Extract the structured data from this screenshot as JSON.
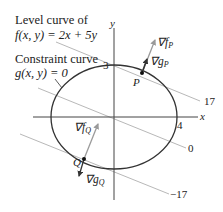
{
  "diagram": {
    "title_annotation_1": {
      "line1": "Level curve of",
      "line2": "f(x, y) = 2x + 5y"
    },
    "title_annotation_2": {
      "line1": "Constraint curve",
      "line2": "g(x, y) = 0"
    },
    "axes": {
      "x_label": "x",
      "y_label": "y"
    },
    "ticks": {
      "y_intercept": "3",
      "x_intercept": "4"
    },
    "level_values": [
      "17",
      "0",
      "−17"
    ],
    "points": {
      "P": "P",
      "Q": "Q"
    },
    "gradients": {
      "grad_f_P": {
        "symbol": "∇f",
        "sub": "P"
      },
      "grad_g_P": {
        "symbol": "∇g",
        "sub": "P"
      },
      "grad_f_Q": {
        "symbol": "∇f",
        "sub": "Q"
      },
      "grad_g_Q": {
        "symbol": "∇g",
        "sub": "Q"
      }
    },
    "colors": {
      "curve": "#333333",
      "level_line": "#b8b8b8",
      "axis": "#444444",
      "grad_f": "#9a9a9a",
      "grad_g": "#333333"
    }
  }
}
